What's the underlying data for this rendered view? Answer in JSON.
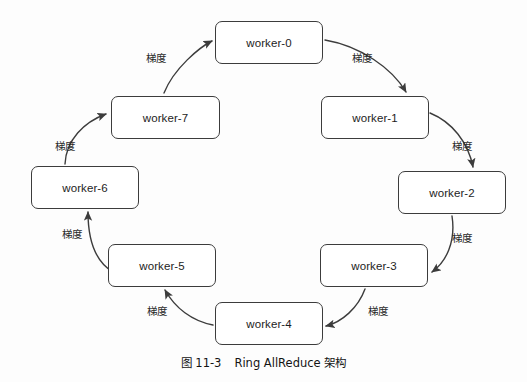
{
  "diagram": {
    "type": "ring-allreduce-architecture",
    "edge_label_text": "梯度",
    "stroke_color": "#3c3c3c",
    "node_fill": "#ffffff",
    "background": "#fdfdfd",
    "nodes": [
      {
        "id": "worker-0",
        "label": "worker-0",
        "x": 215,
        "y": 21,
        "w": 108,
        "h": 43
      },
      {
        "id": "worker-1",
        "label": "worker-1",
        "x": 321,
        "y": 96,
        "w": 108,
        "h": 43
      },
      {
        "id": "worker-2",
        "label": "worker-2",
        "x": 398,
        "y": 171,
        "w": 108,
        "h": 43
      },
      {
        "id": "worker-3",
        "label": "worker-3",
        "x": 320,
        "y": 244,
        "w": 108,
        "h": 43
      },
      {
        "id": "worker-4",
        "label": "worker-4",
        "x": 215,
        "y": 302,
        "w": 108,
        "h": 43
      },
      {
        "id": "worker-5",
        "label": "worker-5",
        "x": 108,
        "y": 244,
        "w": 108,
        "h": 43
      },
      {
        "id": "worker-6",
        "label": "worker-6",
        "x": 31,
        "y": 166,
        "w": 108,
        "h": 43
      },
      {
        "id": "worker-7",
        "label": "worker-7",
        "x": 111,
        "y": 96,
        "w": 109,
        "h": 43
      }
    ],
    "edges": [
      {
        "id": "edge-w0-w1",
        "from": "worker-0",
        "to": "worker-1",
        "label": "梯度",
        "label_x": 352,
        "label_y": 50,
        "path": "M 325 40 C 360 46 392 68 406 92"
      },
      {
        "id": "edge-w1-w2",
        "from": "worker-1",
        "to": "worker-2",
        "label": "梯度",
        "label_x": 452,
        "label_y": 138,
        "path": "M 430 113 C 452 122 468 142 473 167"
      },
      {
        "id": "edge-w2-w3",
        "from": "worker-2",
        "to": "worker-3",
        "label": "梯度",
        "label_x": 452,
        "label_y": 230,
        "path": "M 452 216 C 456 242 446 262 432 272"
      },
      {
        "id": "edge-w3-w4",
        "from": "worker-3",
        "to": "worker-4",
        "label": "梯度",
        "label_x": 368,
        "label_y": 303,
        "path": "M 365 289 C 358 308 342 322 326 326"
      },
      {
        "id": "edge-w4-w5",
        "from": "worker-4",
        "to": "worker-5",
        "label": "梯度",
        "label_x": 147,
        "label_y": 303,
        "path": "M 213 325 C 192 321 175 308 165 290"
      },
      {
        "id": "edge-w5-w6",
        "from": "worker-5",
        "to": "worker-6",
        "label": "梯度",
        "label_x": 62,
        "label_y": 226,
        "path": "M 113 272 C 96 262 88 242 88 212"
      },
      {
        "id": "edge-w6-w7",
        "from": "worker-6",
        "to": "worker-7",
        "label": "梯度",
        "label_x": 55,
        "label_y": 138,
        "path": "M 65 164 C 66 140 84 122 106 114"
      },
      {
        "id": "edge-w7-w0",
        "from": "worker-7",
        "to": "worker-0",
        "label": "梯度",
        "label_x": 146,
        "label_y": 50,
        "path": "M 164 93 C 174 68 200 47 212 41"
      }
    ]
  },
  "caption": {
    "figure_number": "图 11-3",
    "title": "Ring AllReduce 架构"
  }
}
